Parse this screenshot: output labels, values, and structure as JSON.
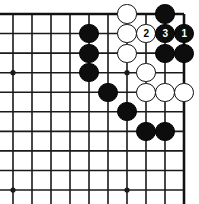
{
  "diagram": {
    "kind": "go-board-diagram",
    "board": {
      "cols": 10,
      "rows": 10,
      "origin_x": 13,
      "origin_y": 14,
      "spacing_x": 19,
      "spacing_y": 19.56,
      "line_color": "#1a1a1a",
      "border_color": "#111111",
      "background_color": "#ffffff",
      "line_width": 1.6,
      "border_width": 2.6,
      "stone_radius": 9.6
    },
    "edges": {
      "top": true,
      "right": true,
      "left": false,
      "bottom": false
    },
    "star_points": [
      {
        "col": 0,
        "row": 3
      },
      {
        "col": 6,
        "row": 3
      },
      {
        "col": 0,
        "row": 9
      },
      {
        "col": 6,
        "row": 9
      }
    ],
    "stones": [
      {
        "color": "white",
        "col": 6,
        "row": 0,
        "label": ""
      },
      {
        "color": "black",
        "col": 8,
        "row": 0,
        "label": ""
      },
      {
        "color": "black",
        "col": 4,
        "row": 1,
        "label": ""
      },
      {
        "color": "white",
        "col": 6,
        "row": 1,
        "label": ""
      },
      {
        "color": "white",
        "col": 7,
        "row": 1,
        "label": "2"
      },
      {
        "color": "black",
        "col": 8,
        "row": 1,
        "label": "3"
      },
      {
        "color": "black",
        "col": 9,
        "row": 1,
        "label": "1"
      },
      {
        "color": "black",
        "col": 4,
        "row": 2,
        "label": ""
      },
      {
        "color": "white",
        "col": 6,
        "row": 2,
        "label": ""
      },
      {
        "color": "black",
        "col": 8,
        "row": 2,
        "label": ""
      },
      {
        "color": "black",
        "col": 9,
        "row": 2,
        "label": ""
      },
      {
        "color": "black",
        "col": 4,
        "row": 3,
        "label": ""
      },
      {
        "color": "white",
        "col": 7,
        "row": 3,
        "label": ""
      },
      {
        "color": "black",
        "col": 5,
        "row": 4,
        "label": ""
      },
      {
        "color": "white",
        "col": 7,
        "row": 4,
        "label": ""
      },
      {
        "color": "white",
        "col": 8,
        "row": 4,
        "label": ""
      },
      {
        "color": "white",
        "col": 9,
        "row": 4,
        "label": ""
      },
      {
        "color": "black",
        "col": 6,
        "row": 5,
        "label": ""
      },
      {
        "color": "black",
        "col": 7,
        "row": 6,
        "label": ""
      },
      {
        "color": "black",
        "col": 8,
        "row": 6,
        "label": ""
      }
    ],
    "move_labels": [
      {
        "number": "1",
        "color": "black"
      },
      {
        "number": "2",
        "color": "white"
      },
      {
        "number": "3",
        "color": "black"
      }
    ]
  }
}
